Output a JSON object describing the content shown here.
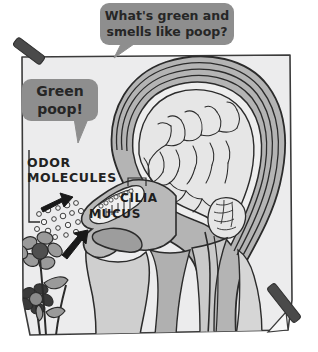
{
  "figure": {
    "kind": "hand-drawn-diagram",
    "paper": {
      "fill": "#ececed",
      "stroke": "#3b3b3b",
      "page_background": "#ffffff"
    },
    "tape": {
      "fill": "#4a4a4a",
      "count": 2,
      "positions": [
        "top-left",
        "bottom-right"
      ]
    }
  },
  "speech_bubbles": [
    {
      "id": "question-bubble",
      "line1": "What's green and",
      "line2": "smells like poop?",
      "fill": "#8e8e8e",
      "text_color": "#2a2a2a",
      "tail": "down-left"
    },
    {
      "id": "answer-bubble",
      "line1": "Green",
      "line2": "poop!",
      "fill": "#8e8e8e",
      "text_color": "#2a2a2a",
      "tail": "down"
    }
  ],
  "labels": [
    {
      "id": "odor-molecules",
      "line1": "ODOR",
      "line2": "MOLECULES"
    },
    {
      "id": "cilia",
      "text": "CILIA"
    },
    {
      "id": "mucus",
      "text": "MUCUS"
    }
  ],
  "palette": {
    "ink": "#2b2b2b",
    "tissue_light": "#d9d9d9",
    "tissue_mid": "#a9a9a9",
    "tissue_dark": "#8a8a8a",
    "brain_fill": "#e4e4e4",
    "flower_gray": "#9a9a9a",
    "flower_dark": "#3a3a3a",
    "arrow": "#1c1c1c",
    "molecule_fill": "#f2f2f2"
  },
  "elements": {
    "arrows": 2,
    "flowers": 2,
    "odor_molecule_dots": 18,
    "brain": "sagittal-cerebrum-and-cerebellum",
    "nasal_cavity": true,
    "tongue": true,
    "spinal_cord": true
  }
}
